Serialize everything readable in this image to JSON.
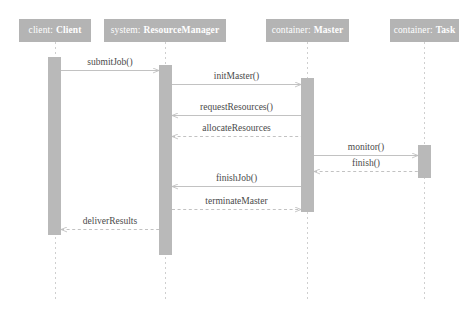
{
  "diagram": {
    "type": "uml-sequence-diagram",
    "title": "",
    "canvas": {
      "width": 475,
      "height": 315
    },
    "colors": {
      "header_fill": "#b4b4b4",
      "header_text": "#ffffff",
      "activation_fill": "#b9b9b9",
      "lifeline_stroke": "#cfcfcf",
      "message_stroke": "#c2c2c2",
      "label_text": "#4a4a4a",
      "background": "#ffffff"
    },
    "lifelines": [
      {
        "id": "client",
        "role": "client:",
        "classifier": "Client",
        "x": 55,
        "box": {
          "x": 19,
          "y": 19,
          "w": 72,
          "h": 23
        },
        "activation": {
          "x": 48,
          "y": 57,
          "w": 13,
          "h": 178
        }
      },
      {
        "id": "resourcemanager",
        "role": "system:",
        "classifier": "ResourceManager",
        "x": 165,
        "box": {
          "x": 104,
          "y": 19,
          "w": 122,
          "h": 23
        },
        "activation": {
          "x": 159,
          "y": 65,
          "w": 13,
          "h": 190
        }
      },
      {
        "id": "master",
        "role": "container:",
        "classifier": "Master",
        "x": 307,
        "box": {
          "x": 266,
          "y": 19,
          "w": 83,
          "h": 23
        },
        "activation": {
          "x": 301,
          "y": 78,
          "w": 13,
          "h": 134
        }
      },
      {
        "id": "task",
        "role": "container:",
        "classifier": "Task",
        "x": 424,
        "box": {
          "x": 390,
          "y": 19,
          "w": 69,
          "h": 23
        },
        "activation": {
          "x": 418,
          "y": 145,
          "w": 13,
          "h": 33
        }
      }
    ],
    "messages": [
      {
        "label": "submitJob()",
        "from": "client",
        "to": "resourcemanager",
        "y": 70,
        "style": "solid",
        "direction": "right"
      },
      {
        "label": "initMaster()",
        "from": "resourcemanager",
        "to": "master",
        "y": 84,
        "style": "solid",
        "direction": "right"
      },
      {
        "label": "requestResources()",
        "from": "master",
        "to": "resourcemanager",
        "y": 115,
        "style": "solid",
        "direction": "left"
      },
      {
        "label": "allocateResources",
        "from": "resourcemanager",
        "to": "master",
        "y": 136,
        "style": "dashed",
        "direction": "left"
      },
      {
        "label": "monitor()",
        "from": "master",
        "to": "task",
        "y": 155,
        "style": "solid",
        "direction": "right"
      },
      {
        "label": "finish()",
        "from": "task",
        "to": "master",
        "y": 171,
        "style": "dashed",
        "direction": "left"
      },
      {
        "label": "finishJob()",
        "from": "master",
        "to": "resourcemanager",
        "y": 186,
        "style": "solid",
        "direction": "left"
      },
      {
        "label": "terminateMaster",
        "from": "resourcemanager",
        "to": "master",
        "y": 209,
        "style": "dashed",
        "direction": "right"
      },
      {
        "label": "deliverResults",
        "from": "resourcemanager",
        "to": "client",
        "y": 229,
        "style": "dashed",
        "direction": "left"
      }
    ]
  }
}
